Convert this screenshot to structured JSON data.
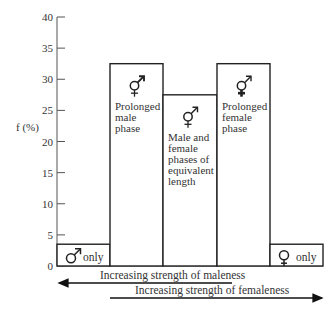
{
  "chart_data": {
    "type": "bar",
    "title": "",
    "xlabel": "",
    "ylabel": "f (%)",
    "ylim": [
      0,
      40
    ],
    "yticks": [
      0,
      5,
      10,
      15,
      20,
      25,
      30,
      35,
      40
    ],
    "grid": false,
    "categories": [
      "♂ only",
      "Prolonged male phase",
      "Male and female phases of equivalent length",
      "Prolonged female phase",
      "♀ only"
    ],
    "values": [
      3.5,
      32.5,
      27.5,
      32.5,
      3.5
    ],
    "bar_symbols": [
      "♂",
      "⚥ (male-dominant)",
      "⚥",
      "⚥ (female-dominant)",
      "♀"
    ],
    "annotations": {
      "bar_labels": [
        [
          "only"
        ],
        [
          "Prolonged",
          "male",
          "phase"
        ],
        [
          "Male and",
          "female",
          "phases of",
          "equivalent",
          "length"
        ],
        [
          "Prolonged",
          "female",
          "phase"
        ],
        [
          "only"
        ]
      ],
      "arrow_left": "Increasing strength of maleness",
      "arrow_right": "Increasing strength of femaleness"
    }
  },
  "axis": {
    "ylabel": "f (%)",
    "ticks": [
      "0",
      "5",
      "10",
      "15",
      "20",
      "25",
      "30",
      "35",
      "40"
    ]
  },
  "bars": [
    {
      "label_lines": [
        "only"
      ],
      "symbol": "male"
    },
    {
      "label_lines": [
        "Prolonged",
        "male",
        "phase"
      ],
      "symbol": "hermaphrodite-male"
    },
    {
      "label_lines": [
        "Male and",
        "female",
        "phases of",
        "equivalent",
        "length"
      ],
      "symbol": "hermaphrodite"
    },
    {
      "label_lines": [
        "Prolonged",
        "female",
        "phase"
      ],
      "symbol": "hermaphrodite-female"
    },
    {
      "label_lines": [
        "only"
      ],
      "symbol": "female"
    }
  ],
  "arrows": {
    "maleness": "Increasing strength of maleness",
    "femaleness": "Increasing strength of femaleness"
  }
}
